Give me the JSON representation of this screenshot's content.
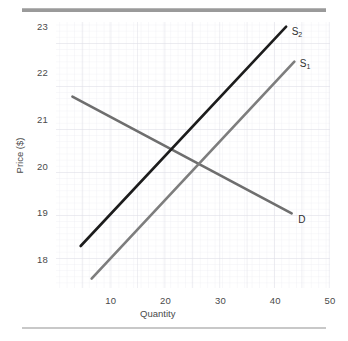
{
  "figure": {
    "top_rule_color": "#9a9a9a",
    "bottom_rule_color": "#c8c8c8",
    "background_color": "#ffffff"
  },
  "chart_data": {
    "type": "line",
    "title": "",
    "xlabel": "Quantity",
    "ylabel": "Price ($)",
    "xlim": [
      0,
      50
    ],
    "ylim": [
      17.4,
      23.1
    ],
    "xticks": [
      10,
      20,
      30,
      40,
      50
    ],
    "yticks": [
      18,
      19,
      20,
      21,
      22,
      23
    ],
    "xtick_labels": [
      "10",
      "20",
      "30",
      "40",
      "50"
    ],
    "ytick_labels": [
      "18",
      "19",
      "20",
      "21",
      "22",
      "23"
    ],
    "grid": true,
    "grid_minor": true,
    "legend": "inline-labels",
    "series": [
      {
        "name": "D",
        "label": "D",
        "color": "#6e6e6e",
        "linewidth": 2.6,
        "points": [
          [
            3,
            21.5
          ],
          [
            43,
            19.0
          ]
        ],
        "label_position": [
          44.2,
          18.85
        ]
      },
      {
        "name": "S1",
        "label": "S",
        "label_sub": "1",
        "color": "#7d7d7d",
        "linewidth": 2.6,
        "points": [
          [
            6.5,
            17.6
          ],
          [
            43.5,
            22.25
          ]
        ],
        "label_position": [
          44.5,
          22.2
        ]
      },
      {
        "name": "S2",
        "label": "S",
        "label_sub": "2",
        "color": "#1c1c1c",
        "linewidth": 2.6,
        "points": [
          [
            4.5,
            18.3
          ],
          [
            42,
            23.0
          ]
        ],
        "label_position": [
          43.0,
          22.88
        ]
      }
    ],
    "annotations": [
      {
        "name": "equilibrium-s2-d",
        "x": 21,
        "y": 20.3
      },
      {
        "name": "equilibrium-s1-d",
        "x": 26,
        "y": 20.0
      }
    ]
  }
}
